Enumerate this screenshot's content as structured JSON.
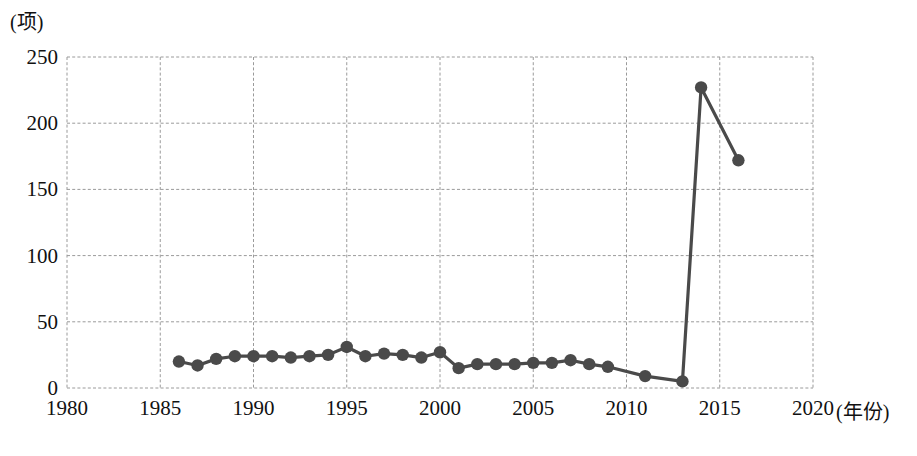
{
  "chart_data": {
    "type": "line",
    "title": "",
    "xlabel": "年份",
    "ylabel": "项",
    "y_unit_label": "(项)",
    "x_unit_label": "(年份)",
    "xlim": [
      1980,
      2020
    ],
    "ylim": [
      0,
      250
    ],
    "xticks": [
      1980,
      1985,
      1990,
      1995,
      2000,
      2005,
      2010,
      2015,
      2020
    ],
    "yticks": [
      0,
      50,
      100,
      150,
      200,
      250
    ],
    "grid": true,
    "grid_style": "dashed",
    "legend": "none",
    "marker": "filled-circle",
    "series_color": "#4a4a4a",
    "x": [
      1986,
      1987,
      1988,
      1989,
      1990,
      1991,
      1992,
      1993,
      1994,
      1995,
      1996,
      1997,
      1998,
      1999,
      2000,
      2001,
      2002,
      2003,
      2004,
      2005,
      2006,
      2007,
      2008,
      2009,
      2011,
      2013,
      2014,
      2016
    ],
    "values": [
      20,
      17,
      22,
      24,
      24,
      24,
      23,
      24,
      25,
      31,
      24,
      26,
      25,
      23,
      27,
      15,
      18,
      18,
      18,
      19,
      19,
      21,
      18,
      16,
      9,
      5,
      227,
      172
    ],
    "series": [
      {
        "name": "项数",
        "color": "#4a4a4a",
        "points": [
          {
            "year": 1986,
            "value": 20
          },
          {
            "year": 1987,
            "value": 17
          },
          {
            "year": 1988,
            "value": 22
          },
          {
            "year": 1989,
            "value": 24
          },
          {
            "year": 1990,
            "value": 24
          },
          {
            "year": 1991,
            "value": 24
          },
          {
            "year": 1992,
            "value": 23
          },
          {
            "year": 1993,
            "value": 24
          },
          {
            "year": 1994,
            "value": 25
          },
          {
            "year": 1995,
            "value": 31
          },
          {
            "year": 1996,
            "value": 24
          },
          {
            "year": 1997,
            "value": 26
          },
          {
            "year": 1998,
            "value": 25
          },
          {
            "year": 1999,
            "value": 23
          },
          {
            "year": 2000,
            "value": 27
          },
          {
            "year": 2001,
            "value": 15
          },
          {
            "year": 2002,
            "value": 18
          },
          {
            "year": 2003,
            "value": 18
          },
          {
            "year": 2004,
            "value": 18
          },
          {
            "year": 2005,
            "value": 19
          },
          {
            "year": 2006,
            "value": 19
          },
          {
            "year": 2007,
            "value": 21
          },
          {
            "year": 2008,
            "value": 18
          },
          {
            "year": 2009,
            "value": 16
          },
          {
            "year": 2011,
            "value": 9
          },
          {
            "year": 2013,
            "value": 5
          },
          {
            "year": 2014,
            "value": 227
          },
          {
            "year": 2016,
            "value": 172
          }
        ]
      }
    ]
  },
  "axis": {
    "y_unit": "(项)",
    "x_unit": "(年份)",
    "y_labels": [
      "250",
      "200",
      "150",
      "100",
      "50",
      "0"
    ],
    "x_labels": [
      "1980",
      "1985",
      "1990",
      "1995",
      "2000",
      "2005",
      "2010",
      "2015",
      "2020"
    ]
  }
}
